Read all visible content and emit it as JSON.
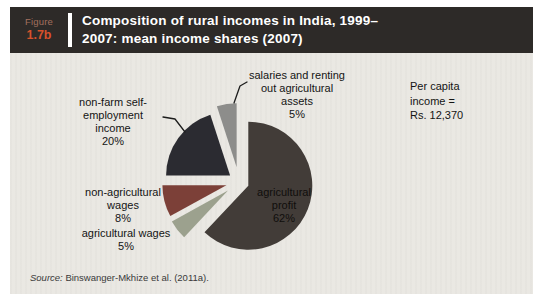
{
  "figure": {
    "eyebrow": "Figure",
    "number": "1.7b",
    "title_lines": [
      "Composition of rural incomes in India, 1999–",
      "2007: mean income shares (2007)"
    ]
  },
  "annotations": {
    "per_capita": {
      "text": "Per capita income = Rs. 12,370",
      "lines": [
        "Per capita",
        "income =",
        "Rs. 12,370"
      ]
    }
  },
  "source": {
    "prefix": "Source:",
    "text": " Binswanger-Mkhize et al. (2011a)."
  },
  "colors": {
    "header_bg": "#2d2a28",
    "plot_bg": "#eae8e3",
    "figure_number": "#d6512b",
    "figure_eyebrow": "#a3705f",
    "title_text": "#ffffff"
  },
  "chart_data": {
    "type": "pie",
    "start_angle_deg": 0,
    "direction": "clockwise",
    "legend": "none",
    "annotation": "Per capita income = Rs. 12,370",
    "slices": [
      {
        "id": "agricultural-profit",
        "label": "agricultural profit",
        "value": 62,
        "color": "#423c38",
        "explode": 10,
        "label_lines": [
          "agricultural",
          "profit",
          "62%"
        ]
      },
      {
        "id": "agricultural-wages",
        "label": "agricultural wages",
        "value": 5,
        "color": "#9ca18e",
        "explode": 14,
        "label_lines": [
          "agricultural wages",
          "5%"
        ]
      },
      {
        "id": "non-agricultural-wages",
        "label": "non-agricultural wages",
        "value": 8,
        "color": "#7c4038",
        "explode": 13,
        "label_lines": [
          "non-agricultural",
          "wages",
          "8%"
        ]
      },
      {
        "id": "non-farm-self-employment",
        "label": "non-farm self-employment income",
        "value": 20,
        "color": "#2b2b31",
        "explode": 11,
        "label_lines": [
          "non-farm self-",
          "employment",
          "income",
          "20%"
        ]
      },
      {
        "id": "salaries-renting",
        "label": "salaries and renting out agricultural assets",
        "value": 5,
        "color": "#8d8d8b",
        "explode": 15,
        "label_lines": [
          "salaries and renting",
          "out agricultural",
          "assets",
          "5%"
        ]
      }
    ]
  }
}
